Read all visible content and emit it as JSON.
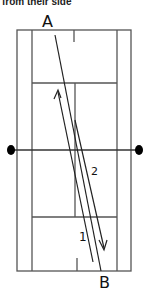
{
  "caption": "from their side",
  "labels": {
    "start": "A",
    "end": "B",
    "shot_1": "1",
    "shot_2": "2"
  },
  "colors": {
    "line": "#555555",
    "ink": "#111111",
    "post": "#000000"
  }
}
